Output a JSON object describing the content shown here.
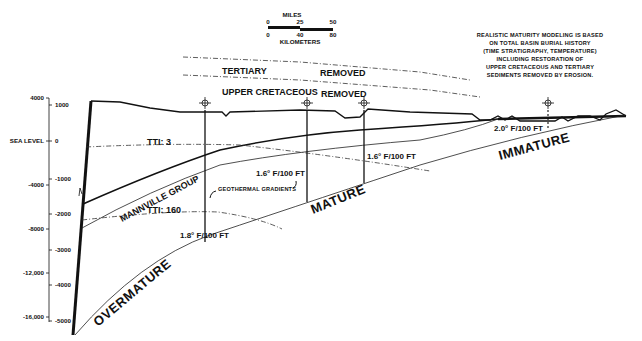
{
  "scale_bar": {
    "miles_label": "MILES",
    "miles_ticks": [
      "0",
      "25",
      "50"
    ],
    "km_label": "KILOMETERS",
    "km_ticks": [
      "0",
      "40",
      "80"
    ]
  },
  "note_lines": [
    "REALISTIC MATURITY MODELING IS BASED",
    "ON TOTAL BASIN BURIAL HISTORY",
    "(TIME  STRATIGRAPHY, TEMPERATURE)",
    "INCLUDING RESTORATION OF",
    "UPPER CRETACEOUS AND TERTIARY",
    "SEDIMENTS REMOVED BY EROSION."
  ],
  "axis_feet": [
    "4000",
    "SEA LEVEL",
    "-4000",
    "-8000",
    "-12,000",
    "-16,000"
  ],
  "axis_meters": [
    "1000",
    "0",
    "-1000",
    "-2000",
    "-3000",
    "-4000",
    "-5000"
  ],
  "removed_units": {
    "tertiary": "TERTIARY",
    "tertiary_removed": "REMOVED",
    "upper_cretaceous": "UPPER CRETACEOUS",
    "uc_removed": "REMOVED"
  },
  "labels": {
    "tti_3": "TTI: 3",
    "tti_160": "TTI: 160",
    "mannville": "MANNVILLE GROUP",
    "geothermal": "GEOTHERMAL GRADIENTS"
  },
  "gradients": [
    {
      "well": 1,
      "value": "1.8° F/100 FT"
    },
    {
      "well": 2,
      "value": "1.6° F/100 FT"
    },
    {
      "well": 3,
      "value": "1.6° F/100 FT"
    },
    {
      "well": 4,
      "value": "2.0° F/100 FT"
    }
  ],
  "zones": {
    "overmature": "OVERMATURE",
    "mature": "MATURE",
    "immature": "IMMATURE"
  }
}
